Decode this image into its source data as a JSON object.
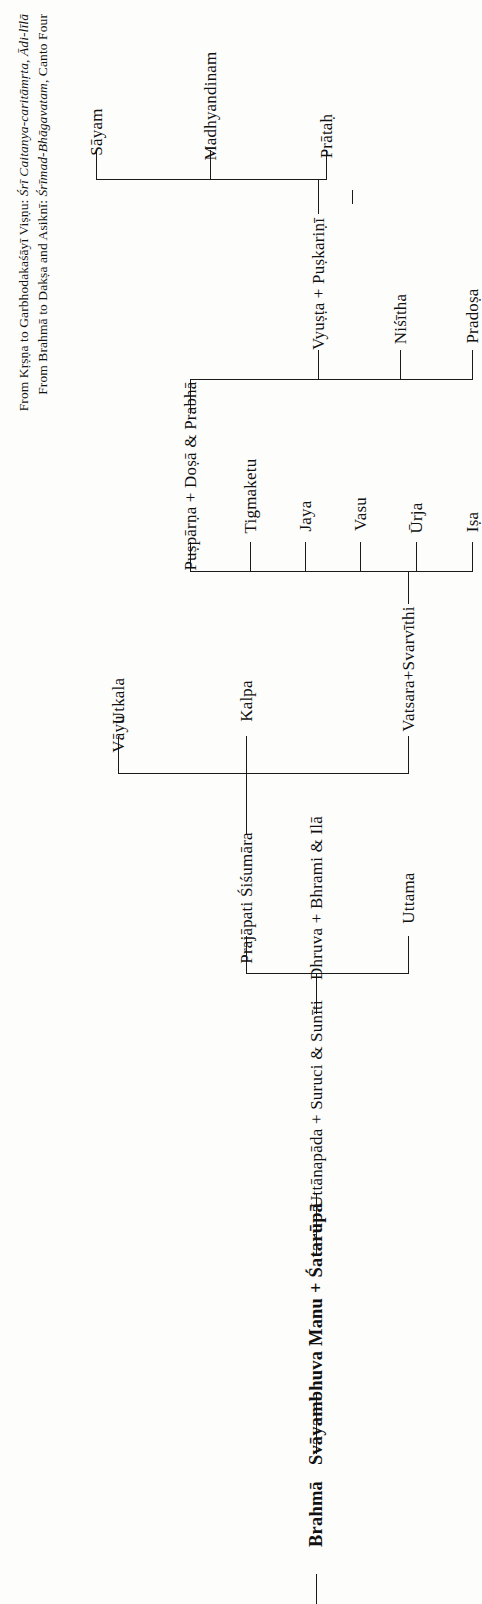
{
  "document": {
    "type": "genealogical-chart",
    "header": {
      "line1_prefix": "From Kṛṣṇa to Garbhodakaśāyī Viṣṇu: ",
      "line1_source": "Śrī Caitanya-caritāmṛta, Ādi-līlā",
      "line2_prefix": "From Brahmā to Dakṣa and Asiknī: ",
      "line2_source": "Śrīmad-Bhāgavatam",
      "line2_suffix": ", Canto Four"
    },
    "nodes": {
      "brahma": "Brahmā",
      "svayambhuva": "Svāyambhuva Manu + Śatarūpā",
      "uttanapada": "Uttānapāda + Suruci & Sunīti",
      "prajapati": "Prajāpati Śiśumāra",
      "uttama": "Uttama",
      "dhruva": "Dhruva + Bhrami & Ilā",
      "vayu": "Vāyu",
      "vatsara": "Vatsara+Svarvīthi",
      "kalpa": "Kalpa",
      "utkala": "Utkala",
      "isa": "Iṣa",
      "urja": "Ūrja",
      "vasu": "Vasu",
      "jaya": "Jaya",
      "tigmaketu": "Tigmaketu",
      "pusparna": "Puṣpārṇa + Doṣā & Prabhā",
      "pradosa": "Pradoṣa",
      "nisitha": "Niśītha",
      "vyusta": "Vyuṣṭa + Puṣkariṇī",
      "pratah": "Prātaḥ",
      "madhyandinam": "Madhyandinam",
      "sayam": "Sāyam"
    },
    "colors": {
      "ink": "#1a1a1a",
      "paper": "#fdfdfb"
    }
  }
}
